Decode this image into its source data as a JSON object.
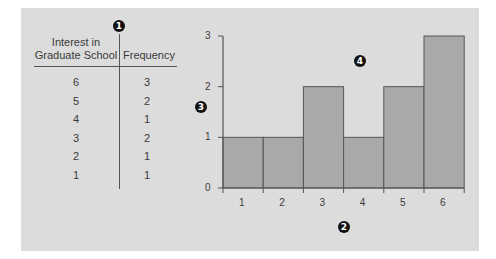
{
  "table": {
    "headers": [
      "Interest in Graduate School",
      "Frequency"
    ],
    "header_line1": "Interest in",
    "header_line2": "Graduate School",
    "header_freq": "Frequency",
    "rows": [
      {
        "value": "6",
        "frequency": "3"
      },
      {
        "value": "5",
        "frequency": "2"
      },
      {
        "value": "4",
        "frequency": "1"
      },
      {
        "value": "3",
        "frequency": "2"
      },
      {
        "value": "2",
        "frequency": "1"
      },
      {
        "value": "1",
        "frequency": "1"
      }
    ]
  },
  "markers": {
    "m1": "1",
    "m2": "2",
    "m3": "3",
    "m4": "4"
  },
  "colors": {
    "panel_bg": "#dcdcdc",
    "bar_fill": "#a9a9a9",
    "line": "#555555"
  },
  "chart_data": {
    "type": "bar",
    "title": "",
    "xlabel": "",
    "ylabel": "",
    "categories": [
      "1",
      "2",
      "3",
      "4",
      "5",
      "6"
    ],
    "values": [
      1,
      1,
      2,
      1,
      2,
      3
    ],
    "yticks": [
      "0",
      "1",
      "2",
      "3"
    ],
    "ylim": [
      0,
      3
    ],
    "grid": false,
    "legend": null,
    "annotations": [
      "marker 1 (table divider)",
      "marker 2 (x-axis)",
      "marker 3 (y-axis)",
      "marker 4 (bars)"
    ]
  }
}
